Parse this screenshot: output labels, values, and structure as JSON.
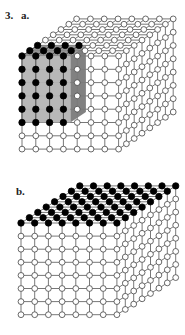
{
  "figure": {
    "number_label": "3.",
    "panels": [
      {
        "id": "a",
        "label": "a.",
        "label_pos": [
          21,
          19
        ],
        "grid": {
          "cols": 8,
          "rows": 8,
          "depth": 8
        },
        "origin_front_top_left": [
          22,
          56
        ],
        "step": {
          "col": 13.8,
          "row": 13.3,
          "depth_dx": 7.8,
          "depth_dy": -5.3
        },
        "highlight": {
          "description": "shaded sub-cube of filled sites",
          "cols": 4,
          "rows": 6,
          "depth": 3,
          "filled_color": "#000000",
          "front_face_color": "#b4b4b4",
          "side_face_color": "#7a7a7a",
          "top_face_color": "#8a8a8a"
        }
      },
      {
        "id": "b",
        "label": "b.",
        "label_pos": [
          16,
          195
        ],
        "grid": {
          "cols": 8,
          "rows": 8,
          "depth": 8
        },
        "origin_front_top_left": [
          21,
          223
        ],
        "step": {
          "col": 13.7,
          "row": 13.1,
          "depth_dx": 8.4,
          "depth_dy": -5.3
        },
        "highlight": {
          "description": "top layer of filled sites",
          "filled_layer": "top",
          "filled_color": "#000000"
        }
      }
    ],
    "number_label_pos": [
      5,
      19
    ],
    "colors": {
      "line": "#555555",
      "empty_fill": "#ffffff",
      "empty_stroke": "#444444",
      "filled": "#000000"
    }
  }
}
